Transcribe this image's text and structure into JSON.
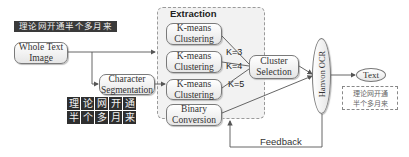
{
  "diagram": {
    "input_banner_text": "理论网开通半个多月来",
    "nodes": {
      "whole_text_image": "Whole Text Image",
      "character_segmentation": "Character Segmentation",
      "kmeans_1": "K-means Clustering",
      "kmeans_2": "K-means Clustering",
      "kmeans_3": "K-means Clustering",
      "binary_conversion": "Binary Conversion",
      "cluster_selection": "Cluster Selection",
      "hanvon_ocr": "Hanvon OCR",
      "text": "Text"
    },
    "extraction_group_title": "Extraction",
    "k_labels": [
      "K=3",
      "K=4",
      "K=5"
    ],
    "segmented_chars": [
      "理",
      "论",
      "网",
      "开",
      "通",
      "半",
      "个",
      "多",
      "月",
      "来"
    ],
    "result_text_lines": [
      "理论网开通",
      "半个多月来"
    ],
    "feedback_label": "Feedback",
    "colors": {
      "node_border": "#7a7a7a",
      "group_fill": "#f2f2f2",
      "char_tile": "#2f2f2f",
      "wire": "#555555"
    }
  }
}
